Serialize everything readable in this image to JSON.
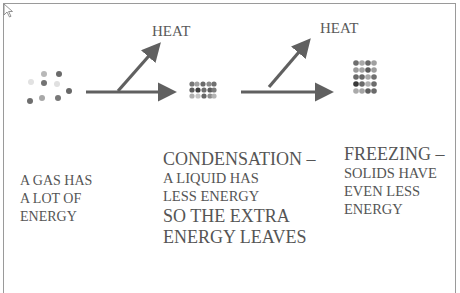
{
  "slide": {
    "top_partial_text": "…ry … g … ),",
    "diagram": {
      "heat_label_1": "HEAT",
      "heat_label_2": "HEAT",
      "arrow_color": "#606060",
      "states": [
        "gas",
        "liquid",
        "solid"
      ]
    },
    "gas_text": {
      "lines": [
        "A GAS HAS",
        "A LOT OF",
        "ENERGY"
      ]
    },
    "condensation_text": {
      "title": "CONDENSATION –",
      "lines": [
        "A LIQUID HAS",
        "LESS ENERGY"
      ],
      "extra_lines": [
        "SO THE EXTRA",
        "ENERGY LEAVES"
      ]
    },
    "freezing_text": {
      "title": "FREEZING –",
      "lines": [
        "SOLIDS HAVE",
        "EVEN LESS",
        "ENERGY"
      ]
    }
  }
}
